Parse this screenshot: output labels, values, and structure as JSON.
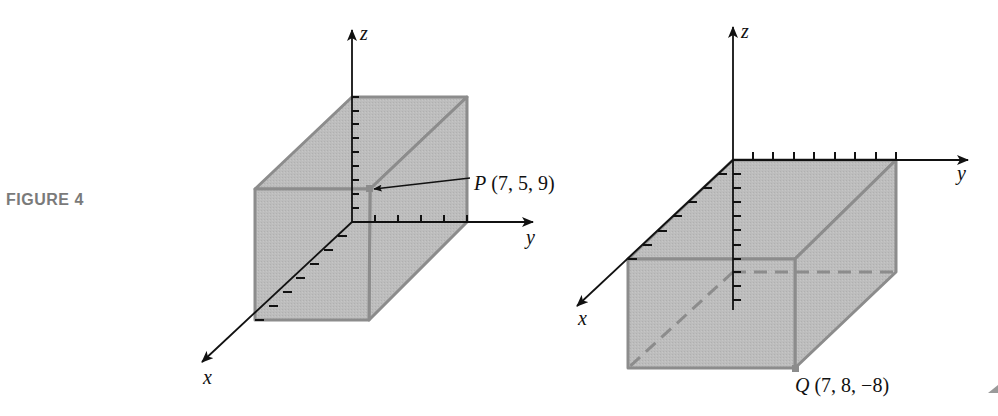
{
  "figure": {
    "caption": "FIGURE 4"
  },
  "colors": {
    "box_fill": "#bcbcbc",
    "box_edge": "#8c8c8c",
    "axis": "#111111",
    "caption": "#7a7a7a"
  },
  "left_diagram": {
    "axes": {
      "x_label": "x",
      "y_label": "y",
      "z_label": "z"
    },
    "point": {
      "name": "P",
      "coords_text": "(7, 5, 9)",
      "x": 7,
      "y": 5,
      "z": 9
    },
    "ticks": {
      "x_count": 7,
      "y_count": 5,
      "z_count": 9
    }
  },
  "right_diagram": {
    "axes": {
      "x_label": "x",
      "y_label": "y",
      "z_label": "z"
    },
    "point": {
      "name": "Q",
      "coords_text": "(7, 8, −8)",
      "x": 7,
      "y": 8,
      "z": -8
    },
    "ticks": {
      "x_count": 7,
      "y_count": 8,
      "z_count": 8
    }
  }
}
